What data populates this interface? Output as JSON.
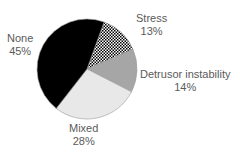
{
  "chart_data": {
    "type": "pie",
    "title": "",
    "slices": [
      {
        "label": "Stress",
        "value": 13,
        "value_label": "13%",
        "fill": "pattern-dots",
        "color": "#ffffff"
      },
      {
        "label": "Detrusor instability",
        "value": 14,
        "value_label": "14%",
        "fill": "solid",
        "color": "#a6a6a6"
      },
      {
        "label": "Mixed",
        "value": 28,
        "value_label": "28%",
        "fill": "solid",
        "color": "#e8e8e8"
      },
      {
        "label": "None",
        "value": 45,
        "value_label": "45%",
        "fill": "solid",
        "color": "#000000"
      }
    ],
    "start_angle_deg": 20,
    "direction": "clockwise",
    "legend": "none",
    "labels": "outside"
  }
}
